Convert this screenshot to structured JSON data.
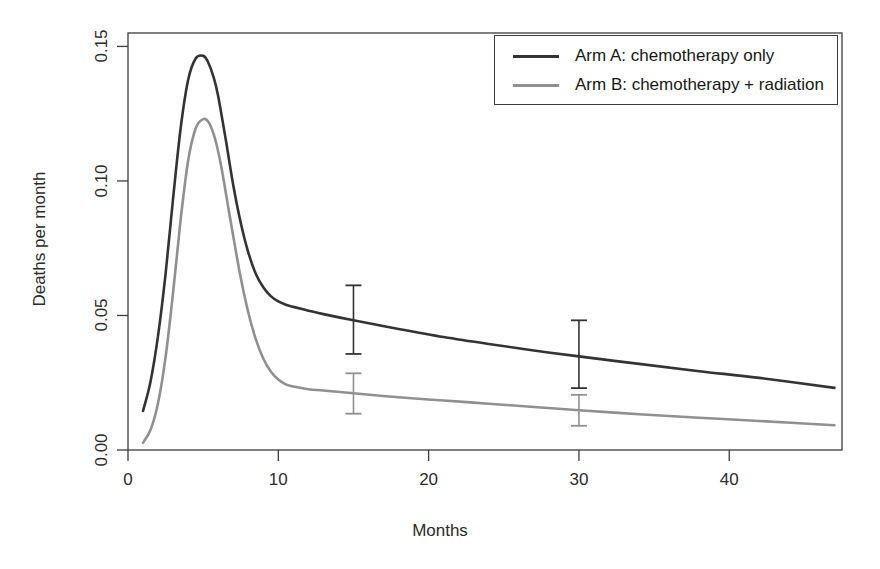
{
  "chart_data": {
    "type": "line",
    "title": "",
    "xlabel": "Months",
    "ylabel": "Deaths per month",
    "xlim": [
      0,
      47.5
    ],
    "ylim": [
      0.0,
      0.155
    ],
    "xticks": [
      0,
      10,
      20,
      30,
      40
    ],
    "xtick_labels": [
      "0",
      "10",
      "20",
      "30",
      "40"
    ],
    "yticks": [
      0.0,
      0.05,
      0.1,
      0.15
    ],
    "ytick_labels": [
      "0.00",
      "0.05",
      "0.10",
      "0.15"
    ],
    "grid": false,
    "legend_position": "top-right",
    "series": [
      {
        "name": "Arm A: chemotherapy only",
        "color": "#333333",
        "linewidth": 2.6,
        "x": [
          1.0,
          1.5,
          2.0,
          2.5,
          3.0,
          3.5,
          4.0,
          4.5,
          5.0,
          5.3,
          5.7,
          6.0,
          6.5,
          7.0,
          7.5,
          8.0,
          8.5,
          9.0,
          9.5,
          10.0,
          10.5,
          11.0,
          12.0,
          13.0,
          15.0,
          18.0,
          21.0,
          24.0,
          27.0,
          30.0,
          34.0,
          38.0,
          42.0,
          47.0
        ],
        "y": [
          0.0145,
          0.0255,
          0.0425,
          0.0655,
          0.0935,
          0.1195,
          0.1375,
          0.1455,
          0.1465,
          0.1445,
          0.1385,
          0.1315,
          0.1155,
          0.0985,
          0.0845,
          0.0735,
          0.0655,
          0.0605,
          0.0572,
          0.0552,
          0.054,
          0.0532,
          0.0518,
          0.0505,
          0.0482,
          0.045,
          0.042,
          0.0394,
          0.037,
          0.0348,
          0.032,
          0.0293,
          0.0268,
          0.0231
        ]
      },
      {
        "name": "Arm B: chemotherapy + radiation",
        "color": "#909090",
        "linewidth": 2.6,
        "x": [
          1.0,
          1.5,
          2.0,
          2.5,
          3.0,
          3.5,
          4.0,
          4.5,
          5.0,
          5.4,
          5.8,
          6.2,
          6.6,
          7.0,
          7.5,
          8.0,
          8.5,
          9.0,
          9.5,
          10.0,
          10.5,
          11.0,
          12.0,
          13.0,
          15.0,
          18.0,
          21.0,
          24.0,
          27.0,
          30.0,
          34.0,
          38.0,
          42.0,
          47.0
        ],
        "y": [
          0.0027,
          0.0075,
          0.0175,
          0.0345,
          0.0585,
          0.0855,
          0.1075,
          0.1195,
          0.123,
          0.1215,
          0.1155,
          0.1055,
          0.0925,
          0.0795,
          0.064,
          0.0512,
          0.0412,
          0.034,
          0.0292,
          0.0262,
          0.0244,
          0.0236,
          0.0226,
          0.0221,
          0.0211,
          0.0196,
          0.0184,
          0.0172,
          0.016,
          0.0148,
          0.0133,
          0.012,
          0.0108,
          0.0092
        ]
      }
    ],
    "error_bars": [
      {
        "series": "Arm A: chemotherapy only",
        "color": "#333333",
        "x": 15,
        "y": 0.0482,
        "lower": 0.0357,
        "upper": 0.0612
      },
      {
        "series": "Arm B: chemotherapy + radiation",
        "color": "#909090",
        "x": 15,
        "y": 0.0211,
        "lower": 0.0135,
        "upper": 0.0285
      },
      {
        "series": "Arm A: chemotherapy only",
        "color": "#333333",
        "x": 30,
        "y": 0.0348,
        "lower": 0.023,
        "upper": 0.0482
      },
      {
        "series": "Arm B: chemotherapy + radiation",
        "color": "#909090",
        "x": 30,
        "y": 0.0148,
        "lower": 0.009,
        "upper": 0.0205
      }
    ]
  },
  "axes": {
    "xlabel": "Months",
    "ylabel": "Deaths per month"
  },
  "legend": {
    "entries": [
      {
        "label": "Arm A: chemotherapy only",
        "color": "#333333"
      },
      {
        "label": "Arm B: chemotherapy + radiation",
        "color": "#909090"
      }
    ]
  }
}
